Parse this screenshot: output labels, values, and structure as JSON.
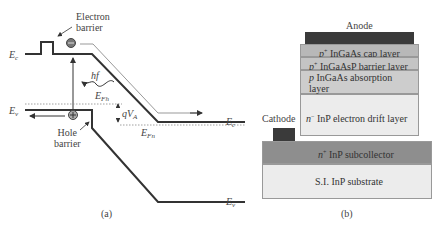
{
  "panel_a": {
    "caption": "(a)",
    "labels": {
      "electron_barrier_line1": "Electron",
      "electron_barrier_line2": "barrier",
      "hole_barrier_line1": "Hole",
      "hole_barrier_line2": "barrier",
      "ec_left": "E",
      "ec_left_sub": "c",
      "ev_left": "E",
      "ev_left_sub": "v",
      "ec_right": "E",
      "ec_right_sub": "c",
      "ev_right": "E",
      "ev_right_sub": "v",
      "efh": "E",
      "efh_sub": "Fh",
      "efn": "E",
      "efn_sub": "Fn",
      "photon": "hf",
      "qva": "qV",
      "qva_sub": "A"
    },
    "colors": {
      "band_line": "#333333",
      "dashed": "#888888",
      "particle": "#555555"
    }
  },
  "panel_b": {
    "caption": "(b)",
    "anode_label": "Anode",
    "cathode_label": "Cathode",
    "layers": [
      {
        "prefix": "p",
        "prefix_sup": "+",
        "text": " InGaAs cap layer",
        "color": "#b8b8b8"
      },
      {
        "prefix": "p",
        "prefix_sup": "+",
        "text": " InGaAsP barrier layer",
        "color": "#c4c4c4"
      },
      {
        "prefix": "p",
        "prefix_sup": "",
        "text": " InGaAs absorption layer",
        "color": "#cdcdcd"
      },
      {
        "prefix": "n",
        "prefix_sup": "−",
        "text": " InP electron drift layer",
        "color": "#ececec"
      },
      {
        "prefix": "n",
        "prefix_sup": "+",
        "text": " InP subcollector",
        "color": "#8e8e8e"
      },
      {
        "prefix": "",
        "prefix_sup": "",
        "text": "S.I. InP substrate",
        "color": "#ececec"
      }
    ],
    "colors": {
      "contact": "#3a3a3a"
    }
  }
}
